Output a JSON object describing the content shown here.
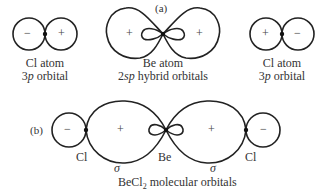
{
  "panel_a": {
    "label": "(a)",
    "left_atom": {
      "line1": "Cl atom",
      "line2_prefix": "3",
      "line2_italic": "p",
      "line2_suffix": " orbital",
      "left_sign": "−",
      "right_sign": "+"
    },
    "center_atom": {
      "line1": "Be atom",
      "line2_prefix": "2",
      "line2_italic": "sp",
      "line2_suffix": " hybrid orbitals",
      "left_sign": "+",
      "right_sign": "+",
      "inner_left_sign": "−",
      "inner_right_sign": "−"
    },
    "right_atom": {
      "line1": "Cl atom",
      "line2_prefix": "3",
      "line2_italic": "p",
      "line2_suffix": " orbital",
      "left_sign": "+",
      "right_sign": "−"
    }
  },
  "panel_b": {
    "label": "(b)",
    "left_cl": "Cl",
    "be": "Be",
    "right_cl": "Cl",
    "left_sigma": "σ",
    "right_sigma": "σ",
    "left_small_sign": "−",
    "left_lobe_sign": "+",
    "right_lobe_sign": "+",
    "right_small_sign": "−",
    "caption_prefix": "BeCl",
    "caption_sub": "2",
    "caption_suffix": " molecular orbitals"
  }
}
